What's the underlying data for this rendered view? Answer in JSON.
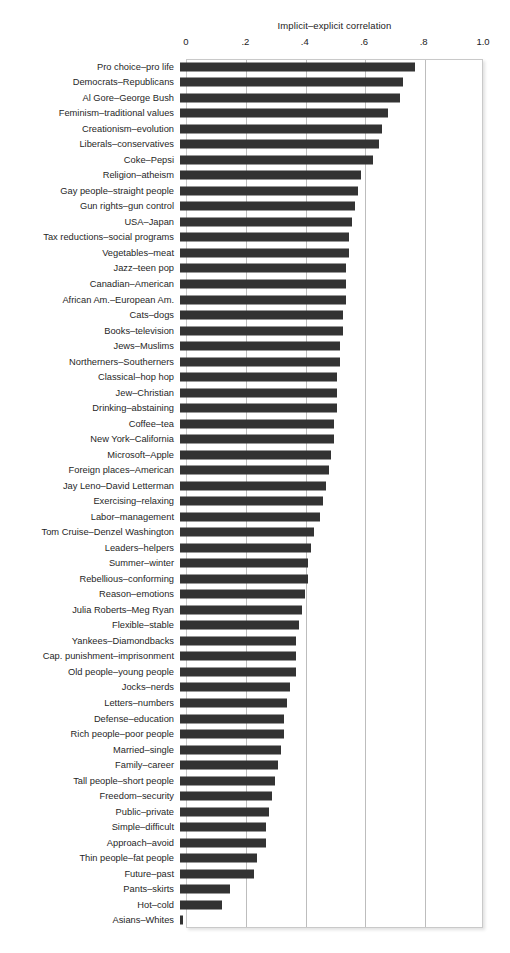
{
  "chart_data": {
    "type": "bar",
    "orientation": "horizontal",
    "title": "Implicit–explicit correlation",
    "xlabel": "Implicit–explicit correlation",
    "ylabel": "",
    "xlim": [
      0,
      1.0
    ],
    "xticks": [
      0,
      0.2,
      0.4,
      0.6,
      0.8,
      1.0
    ],
    "xtick_labels": [
      "0",
      ".2",
      ".4",
      ".6",
      ".8",
      "1.0"
    ],
    "grid": true,
    "grid_axis": "x",
    "legend": false,
    "bar_color": "#333333",
    "frame_color": "#c9c9c9",
    "gridline_color": "#bdbdbd",
    "categories": [
      "Pro choice–pro life",
      "Democrats–Republicans",
      "Al Gore–George Bush",
      "Feminism–traditional values",
      "Creationism–evolution",
      "Liberals–conservatives",
      "Coke–Pepsi",
      "Religion–atheism",
      "Gay people–straight people",
      "Gun rights–gun control",
      "USA–Japan",
      "Tax reductions–social programs",
      "Vegetables–meat",
      "Jazz–teen pop",
      "Canadian–American",
      "African Am.–European Am.",
      "Cats–dogs",
      "Books–television",
      "Jews–Muslims",
      "Northerners–Southerners",
      "Classical–hop hop",
      "Jew–Christian",
      "Drinking–abstaining",
      "Coffee–tea",
      "New York–California",
      "Microsoft–Apple",
      "Foreign places–American",
      "Jay Leno–David Letterman",
      "Exercising–relaxing",
      "Labor–management",
      "Tom Cruise–Denzel Washington",
      "Leaders–helpers",
      "Summer–winter",
      "Rebellious–conforming",
      "Reason–emotions",
      "Julia Roberts–Meg Ryan",
      "Flexible–stable",
      "Yankees–Diamondbacks",
      "Cap. punishment–imprisonment",
      "Old people–young people",
      "Jocks–nerds",
      "Letters–numbers",
      "Defense–education",
      "Rich people–poor people",
      "Married–single",
      "Family–career",
      "Tall people–short people",
      "Freedom–security",
      "Public–private",
      "Simple–difficult",
      "Approach–avoid",
      "Thin people–fat people",
      "Future–past",
      "Pants–skirts",
      "Hot–cold",
      "Asians–Whites"
    ],
    "values": [
      0.79,
      0.75,
      0.74,
      0.7,
      0.68,
      0.67,
      0.65,
      0.61,
      0.6,
      0.59,
      0.58,
      0.57,
      0.57,
      0.56,
      0.56,
      0.56,
      0.55,
      0.55,
      0.54,
      0.54,
      0.53,
      0.53,
      0.53,
      0.52,
      0.52,
      0.51,
      0.5,
      0.49,
      0.48,
      0.47,
      0.45,
      0.44,
      0.43,
      0.43,
      0.42,
      0.41,
      0.4,
      0.39,
      0.39,
      0.39,
      0.37,
      0.36,
      0.35,
      0.35,
      0.34,
      0.33,
      0.32,
      0.31,
      0.3,
      0.29,
      0.29,
      0.26,
      0.25,
      0.17,
      0.14,
      0.01
    ]
  }
}
